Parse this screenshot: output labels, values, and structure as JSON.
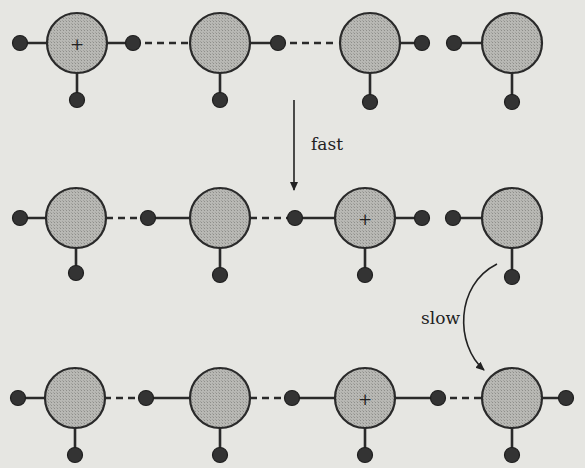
{
  "labels": {
    "fast": "fast",
    "slow": "slow",
    "charge": "+"
  },
  "colors": {
    "background": "#e6e6e2",
    "oxygen_fill": "#b4b4b0",
    "stroke": "#2a2a2a",
    "hydrogen": "#333333"
  },
  "rows": [
    {
      "y": 43,
      "oxygens": [
        {
          "x": 77,
          "charged": true
        },
        {
          "x": 220,
          "charged": false
        },
        {
          "x": 370,
          "charged": false
        },
        {
          "x": 512,
          "charged": false
        }
      ],
      "hydrogens": [
        {
          "x": 20,
          "y": 43,
          "bond_to": 0,
          "type": "covalent"
        },
        {
          "x": 133,
          "y": 43,
          "bond_to": 0,
          "type": "covalent"
        },
        {
          "x": 77,
          "y": 100,
          "bond_to": 0,
          "type": "covalent"
        },
        {
          "x": 278,
          "y": 43,
          "bond_to": 1,
          "type": "covalent"
        },
        {
          "x": 220,
          "y": 100,
          "bond_to": 1,
          "type": "covalent"
        },
        {
          "x": 422,
          "y": 43,
          "bond_to": 2,
          "type": "covalent"
        },
        {
          "x": 370,
          "y": 102,
          "bond_to": 2,
          "type": "covalent"
        },
        {
          "x": 454,
          "y": 43,
          "bond_to": 3,
          "type": "covalent"
        },
        {
          "x": 512,
          "y": 102,
          "bond_to": 3,
          "type": "covalent"
        }
      ],
      "hbonds": [
        [
          133,
          192
        ],
        [
          278,
          336
        ]
      ]
    },
    {
      "y": 218,
      "oxygens": [
        {
          "x": 76,
          "charged": false
        },
        {
          "x": 220,
          "charged": false
        },
        {
          "x": 365,
          "charged": true
        },
        {
          "x": 512,
          "charged": false
        }
      ],
      "hydrogens": [
        {
          "x": 20,
          "y": 218,
          "bond_to": 0,
          "type": "covalent"
        },
        {
          "x": 76,
          "y": 273,
          "bond_to": 0,
          "type": "covalent"
        },
        {
          "x": 148,
          "y": 218,
          "bond_to": 1,
          "type": "covalent"
        },
        {
          "x": 220,
          "y": 275,
          "bond_to": 1,
          "type": "covalent"
        },
        {
          "x": 295,
          "y": 218,
          "bond_to": 2,
          "type": "covalent"
        },
        {
          "x": 422,
          "y": 218,
          "bond_to": 2,
          "type": "covalent"
        },
        {
          "x": 365,
          "y": 275,
          "bond_to": 2,
          "type": "covalent"
        },
        {
          "x": 453,
          "y": 218,
          "bond_to": 3,
          "type": "covalent"
        },
        {
          "x": 512,
          "y": 277,
          "bond_to": 3,
          "type": "covalent"
        }
      ],
      "hbonds": [
        [
          106,
          148
        ],
        [
          250,
          295
        ]
      ]
    },
    {
      "y": 398,
      "oxygens": [
        {
          "x": 75,
          "charged": false
        },
        {
          "x": 220,
          "charged": false
        },
        {
          "x": 365,
          "charged": true
        },
        {
          "x": 512,
          "charged": false
        }
      ],
      "hydrogens": [
        {
          "x": 18,
          "y": 398,
          "bond_to": 0,
          "type": "covalent"
        },
        {
          "x": 75,
          "y": 455,
          "bond_to": 0,
          "type": "covalent"
        },
        {
          "x": 146,
          "y": 398,
          "bond_to": 1,
          "type": "covalent"
        },
        {
          "x": 220,
          "y": 455,
          "bond_to": 1,
          "type": "covalent"
        },
        {
          "x": 292,
          "y": 398,
          "bond_to": 2,
          "type": "covalent"
        },
        {
          "x": 365,
          "y": 455,
          "bond_to": 2,
          "type": "covalent"
        },
        {
          "x": 438,
          "y": 398,
          "bond_to": 2,
          "type": "covalent"
        },
        {
          "x": 566,
          "y": 398,
          "bond_to": 3,
          "type": "covalent"
        },
        {
          "x": 512,
          "y": 455,
          "bond_to": 3,
          "type": "covalent"
        }
      ],
      "hbonds": [
        [
          104,
          146
        ],
        [
          250,
          292
        ],
        [
          438,
          484
        ]
      ]
    }
  ],
  "arrows": {
    "fast": {
      "x": 294,
      "y1": 100,
      "y2": 192,
      "label_x": 312,
      "label_y": 145
    },
    "slow": {
      "label_x": 426,
      "label_y": 323
    }
  }
}
